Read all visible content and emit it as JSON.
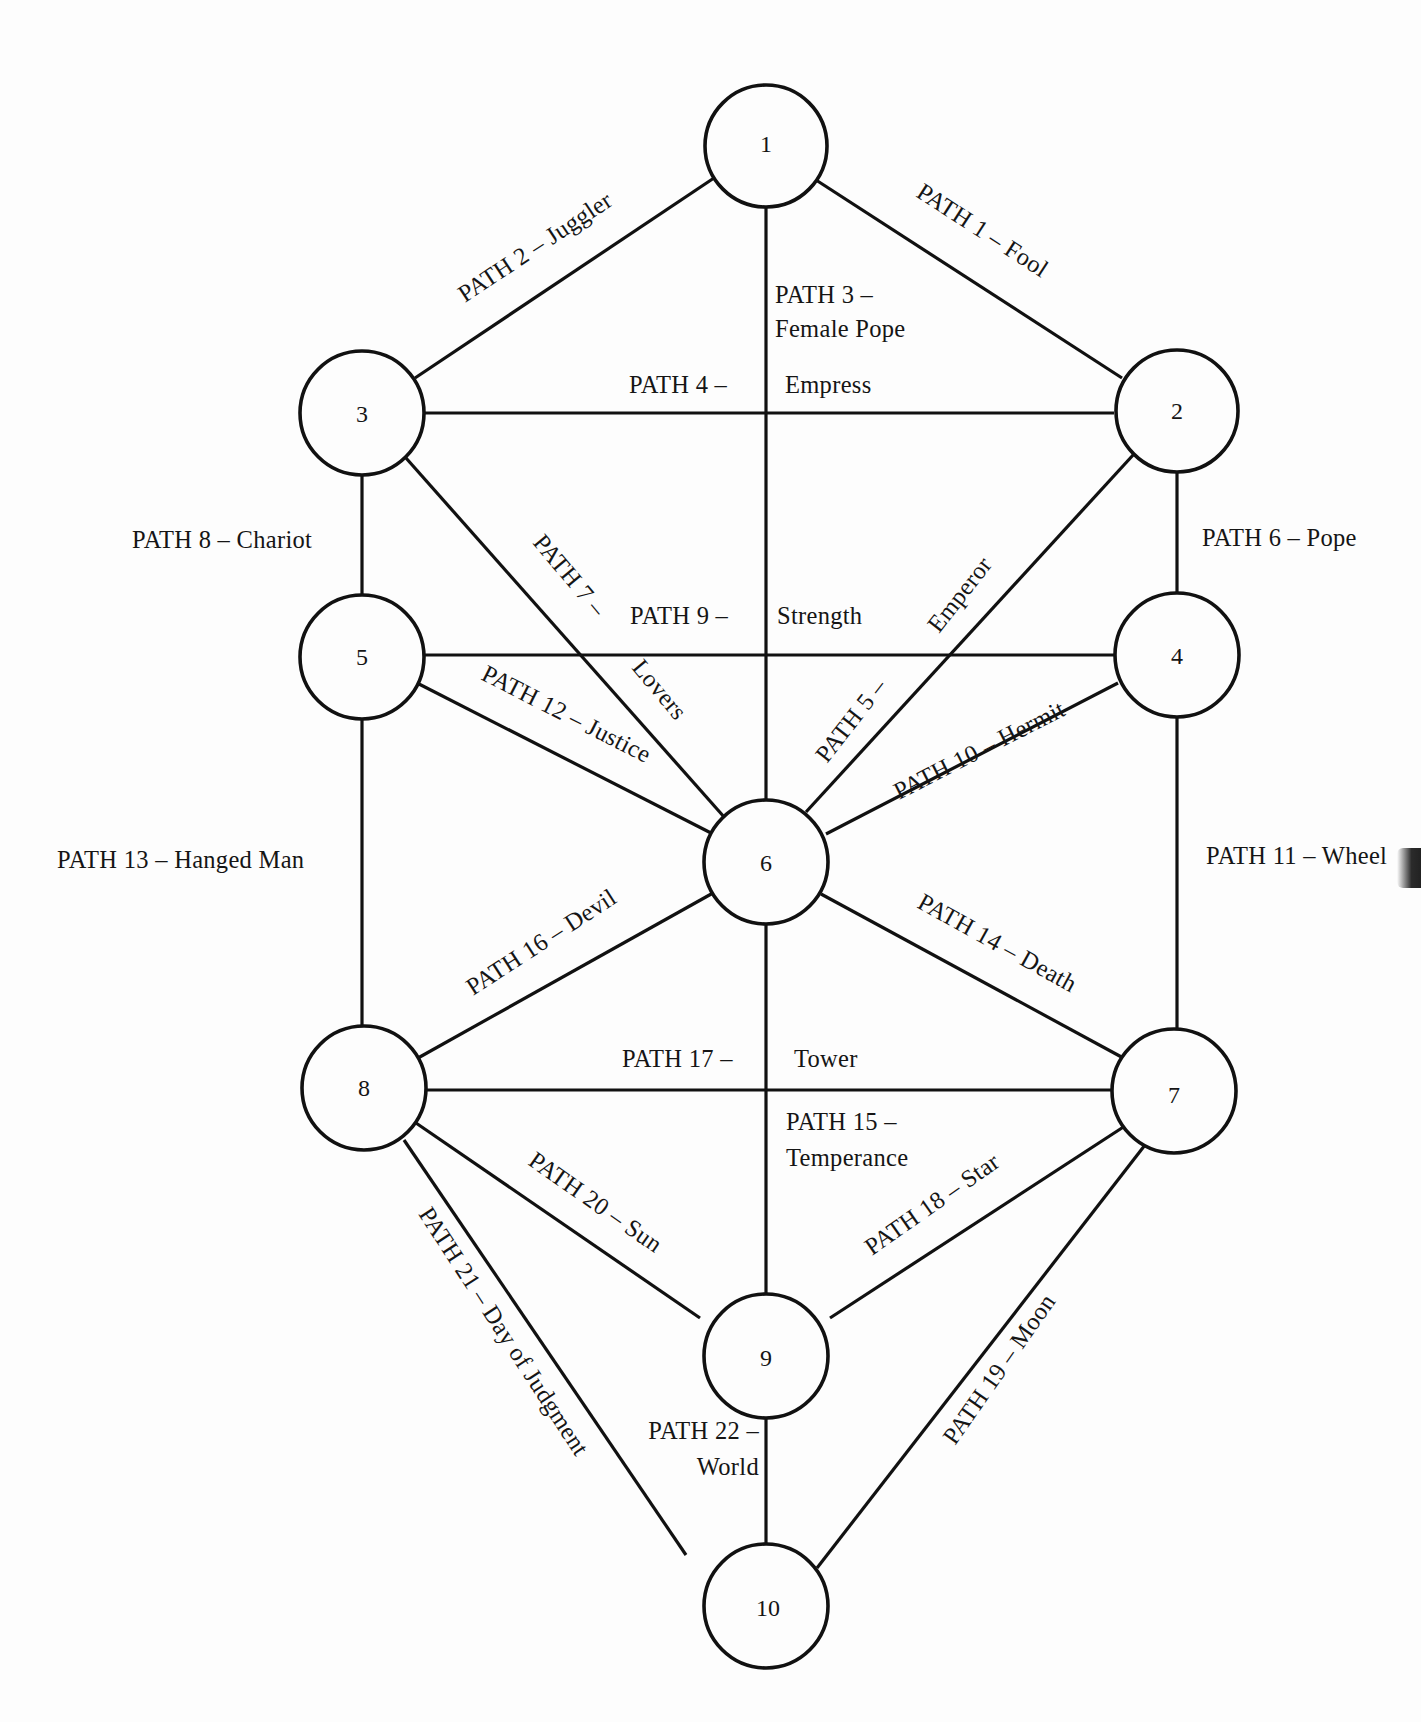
{
  "diagram": {
    "type": "tree-of-life",
    "nodes": [
      {
        "id": "1",
        "label": "1"
      },
      {
        "id": "2",
        "label": "2"
      },
      {
        "id": "3",
        "label": "3"
      },
      {
        "id": "4",
        "label": "4"
      },
      {
        "id": "5",
        "label": "5"
      },
      {
        "id": "6",
        "label": "6"
      },
      {
        "id": "7",
        "label": "7"
      },
      {
        "id": "8",
        "label": "8"
      },
      {
        "id": "9",
        "label": "9"
      },
      {
        "id": "10",
        "label": "10"
      }
    ],
    "paths": [
      {
        "num": 1,
        "from": "1",
        "to": "2",
        "label": "PATH 1 – Fool"
      },
      {
        "num": 2,
        "from": "1",
        "to": "3",
        "label": "PATH 2 – Juggler"
      },
      {
        "num": 3,
        "from": "1",
        "to": "6",
        "label_line1": "PATH 3 –",
        "label_line2": "Female Pope"
      },
      {
        "num": 4,
        "from": "3",
        "to": "2",
        "label_left": "PATH 4 –",
        "label_right": "Empress"
      },
      {
        "num": 5,
        "from": "2",
        "to": "6",
        "label_part1": "PATH 5 –",
        "label_part2": "Emperor"
      },
      {
        "num": 6,
        "from": "2",
        "to": "4",
        "label": "PATH 6 – Pope"
      },
      {
        "num": 7,
        "from": "3",
        "to": "6",
        "label_part1": "PATH 7 –",
        "label_part2": "Lovers"
      },
      {
        "num": 8,
        "from": "3",
        "to": "5",
        "label": "PATH 8 – Chariot"
      },
      {
        "num": 9,
        "from": "5",
        "to": "4",
        "label_left": "PATH 9 –",
        "label_right": "Strength"
      },
      {
        "num": 10,
        "from": "4",
        "to": "6",
        "label": "PATH 10 – Hermit"
      },
      {
        "num": 11,
        "from": "4",
        "to": "7",
        "label": "PATH 11 – Wheel"
      },
      {
        "num": 12,
        "from": "5",
        "to": "6",
        "label": "PATH 12 – Justice"
      },
      {
        "num": 13,
        "from": "5",
        "to": "8",
        "label": "PATH 13 – Hanged Man"
      },
      {
        "num": 14,
        "from": "6",
        "to": "7",
        "label": "PATH 14 – Death"
      },
      {
        "num": 15,
        "from": "6",
        "to": "9",
        "label_line1": "PATH 15 –",
        "label_line2": "Temperance"
      },
      {
        "num": 16,
        "from": "6",
        "to": "8",
        "label": "PATH 16 – Devil"
      },
      {
        "num": 17,
        "from": "8",
        "to": "7",
        "label_left": "PATH 17 –",
        "label_right": "Tower"
      },
      {
        "num": 18,
        "from": "7",
        "to": "9",
        "label": "PATH 18 – Star"
      },
      {
        "num": 19,
        "from": "7",
        "to": "10",
        "label": "PATH 19 – Moon"
      },
      {
        "num": 20,
        "from": "8",
        "to": "9",
        "label": "PATH 20 – Sun"
      },
      {
        "num": 21,
        "from": "8",
        "to": "10",
        "label": "PATH 21 – Day of Judgment"
      },
      {
        "num": 22,
        "from": "9",
        "to": "10",
        "label_line1": "PATH 22 –",
        "label_line2": "World"
      }
    ]
  },
  "colors": {
    "ink": "#111111",
    "paper": "#fdfdfd"
  }
}
